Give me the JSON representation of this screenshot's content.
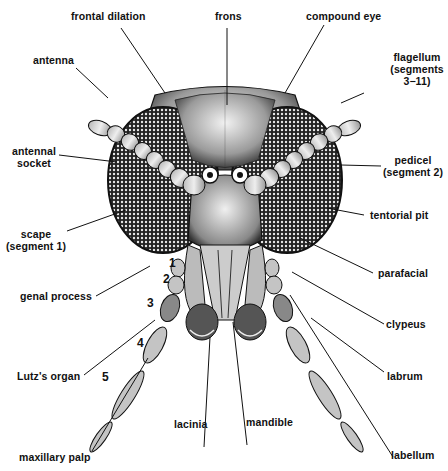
{
  "figure": {
    "labels": {
      "frontal_dilation": "frontal dilation",
      "frons": "frons",
      "compound_eye": "compound eye",
      "antenna": "antenna",
      "flagellum_1": "flagellum",
      "flagellum_2": "(segments",
      "flagellum_3": "3−11)",
      "antennal_socket_1": "antennal",
      "antennal_socket_2": "socket",
      "pedicel_1": "pedicel",
      "pedicel_2": "(segment 2)",
      "scape_1": "scape",
      "scape_2": "(segment 1)",
      "tentorial_pit": "tentorial pit",
      "parafacial": "parafacial",
      "genal_process": "genal process",
      "clypeus": "clypeus",
      "lutzs_organ": "Lutz's organ",
      "labrum": "labrum",
      "maxillary_palp": "maxillary palp",
      "lacinia": "lacinia",
      "mandible": "mandible",
      "labellum": "labellum"
    },
    "palp_segment_numbers": [
      "1",
      "2",
      "3",
      "4",
      "5"
    ],
    "colors": {
      "ink": "#111111",
      "background": "#ffffff",
      "shade": "#8a8a8a"
    }
  }
}
